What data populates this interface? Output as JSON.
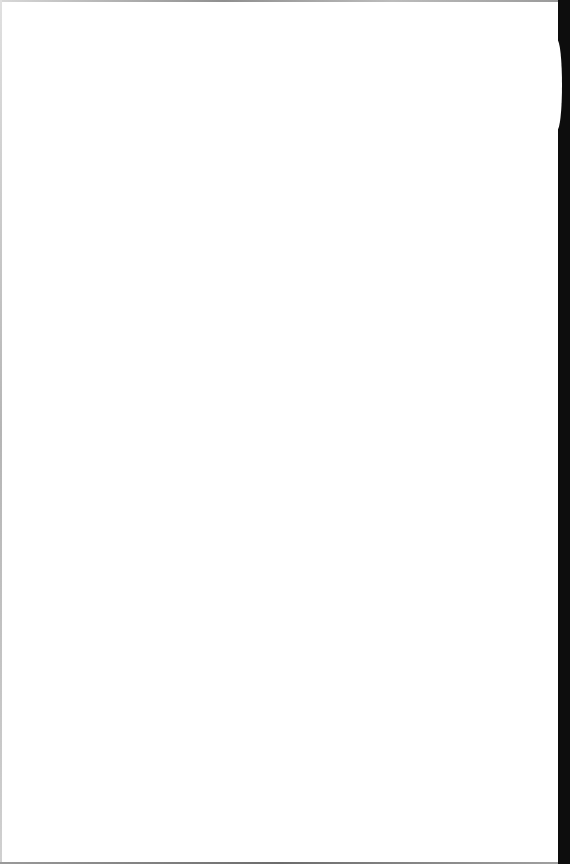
{
  "document": {
    "type": "scanned-page",
    "content": "",
    "colors": {
      "paper": "#ffffff",
      "scan_border": "#0d0d0d"
    }
  }
}
